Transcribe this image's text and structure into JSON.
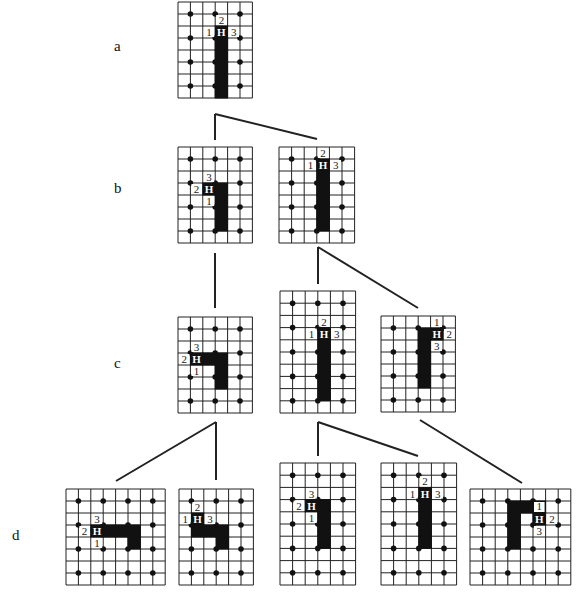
{
  "stage_labels": [
    {
      "id": "a",
      "text": "a",
      "x": 114,
      "y": 38
    },
    {
      "id": "b",
      "text": "b",
      "x": 114,
      "y": 180
    },
    {
      "id": "c",
      "text": "c",
      "x": 114,
      "y": 355
    },
    {
      "id": "d",
      "text": "d",
      "x": 12,
      "y": 527
    }
  ],
  "colors": {
    "line": "#222222",
    "fill": "#111111",
    "dot": "#111111",
    "bg": "#ffffff"
  },
  "grids": [
    {
      "id": "a1",
      "stage": "a",
      "x": 178,
      "y": 2,
      "cols": 6,
      "rows": 8,
      "cw": 12.4,
      "ch": 12.0,
      "dots": {
        "xs": [
          1,
          3,
          5
        ],
        "ys": [
          1,
          3,
          5,
          7
        ]
      },
      "fill": [
        [
          3,
          2
        ],
        [
          3,
          3
        ],
        [
          3,
          4
        ],
        [
          3,
          5
        ],
        [
          3,
          6
        ],
        [
          3,
          7
        ]
      ],
      "H": [
        3,
        2
      ],
      "labels": [
        {
          "t": "2",
          "c": 3,
          "r": 1
        },
        {
          "t": "1",
          "c": 2,
          "r": 2
        },
        {
          "t": "3",
          "c": 4,
          "r": 2
        }
      ]
    },
    {
      "id": "b1",
      "stage": "b",
      "x": 178,
      "y": 147,
      "cols": 6,
      "rows": 8,
      "cw": 12.4,
      "ch": 12.0,
      "dots": {
        "xs": [
          1,
          3,
          5
        ],
        "ys": [
          1,
          3,
          5,
          7
        ]
      },
      "fill": [
        [
          2,
          3
        ],
        [
          3,
          3
        ],
        [
          3,
          4
        ],
        [
          3,
          5
        ],
        [
          3,
          6
        ]
      ],
      "H": [
        2,
        3
      ],
      "labels": [
        {
          "t": "3",
          "c": 2,
          "r": 2
        },
        {
          "t": "2",
          "c": 1,
          "r": 3
        },
        {
          "t": "1",
          "c": 2,
          "r": 4
        }
      ]
    },
    {
      "id": "b2",
      "stage": "b",
      "x": 279,
      "y": 147,
      "cols": 6,
      "rows": 8,
      "cw": 12.6,
      "ch": 12.0,
      "dots": {
        "xs": [
          1,
          3,
          5
        ],
        "ys": [
          1,
          3,
          5,
          7
        ]
      },
      "fill": [
        [
          3,
          1
        ],
        [
          3,
          2
        ],
        [
          3,
          3
        ],
        [
          3,
          4
        ],
        [
          3,
          5
        ],
        [
          3,
          6
        ]
      ],
      "H": [
        3,
        1
      ],
      "labels": [
        {
          "t": "2",
          "c": 3,
          "r": 0
        },
        {
          "t": "1",
          "c": 2,
          "r": 1
        },
        {
          "t": "3",
          "c": 4,
          "r": 1
        }
      ]
    },
    {
      "id": "c1",
      "stage": "c",
      "x": 178,
      "y": 317,
      "cols": 6,
      "rows": 8,
      "cw": 12.4,
      "ch": 12.0,
      "dots": {
        "xs": [
          1,
          3,
          5
        ],
        "ys": [
          1,
          3,
          5,
          7
        ]
      },
      "fill": [
        [
          1,
          3
        ],
        [
          2,
          3
        ],
        [
          3,
          3
        ],
        [
          3,
          4
        ],
        [
          3,
          5
        ]
      ],
      "H": [
        1,
        3
      ],
      "labels": [
        {
          "t": "3",
          "c": 1,
          "r": 2
        },
        {
          "t": "2",
          "c": 0,
          "r": 3
        },
        {
          "t": "1",
          "c": 1,
          "r": 4
        }
      ]
    },
    {
      "id": "c2",
      "stage": "c",
      "x": 280,
      "y": 291,
      "cols": 6,
      "rows": 10,
      "cw": 12.6,
      "ch": 12.2,
      "dots": {
        "xs": [
          1,
          3,
          5
        ],
        "ys": [
          1,
          3,
          5,
          7,
          9
        ]
      },
      "fill": [
        [
          3,
          3
        ],
        [
          3,
          4
        ],
        [
          3,
          5
        ],
        [
          3,
          6
        ],
        [
          3,
          7
        ],
        [
          3,
          8
        ]
      ],
      "H": [
        3,
        3
      ],
      "labels": [
        {
          "t": "2",
          "c": 3,
          "r": 2
        },
        {
          "t": "1",
          "c": 2,
          "r": 3
        },
        {
          "t": "3",
          "c": 4,
          "r": 3
        }
      ]
    },
    {
      "id": "c3",
      "stage": "c",
      "x": 381,
      "y": 316,
      "cols": 6,
      "rows": 8,
      "cw": 12.4,
      "ch": 12.0,
      "dots": {
        "xs": [
          1,
          3,
          5
        ],
        "ys": [
          1,
          3,
          5,
          7
        ]
      },
      "fill": [
        [
          3,
          1
        ],
        [
          4,
          1
        ],
        [
          3,
          2
        ],
        [
          3,
          3
        ],
        [
          3,
          4
        ],
        [
          3,
          5
        ]
      ],
      "H": [
        4,
        1
      ],
      "labels": [
        {
          "t": "1",
          "c": 4,
          "r": 0
        },
        {
          "t": "2",
          "c": 5,
          "r": 1
        },
        {
          "t": "3",
          "c": 4,
          "r": 2
        }
      ]
    },
    {
      "id": "d1",
      "stage": "d",
      "x": 66,
      "y": 489,
      "cols": 8,
      "rows": 8,
      "cw": 12.4,
      "ch": 12.0,
      "dots": {
        "xs": [
          1,
          3,
          5,
          7
        ],
        "ys": [
          1,
          3,
          5,
          7
        ]
      },
      "fill": [
        [
          2,
          3
        ],
        [
          3,
          3
        ],
        [
          4,
          3
        ],
        [
          5,
          3
        ],
        [
          5,
          4
        ]
      ],
      "H": [
        2,
        3
      ],
      "labels": [
        {
          "t": "3",
          "c": 2,
          "r": 2
        },
        {
          "t": "2",
          "c": 1,
          "r": 3
        },
        {
          "t": "1",
          "c": 2,
          "r": 4
        }
      ]
    },
    {
      "id": "d2",
      "stage": "d",
      "x": 179,
      "y": 489,
      "cols": 6,
      "rows": 8,
      "cw": 12.4,
      "ch": 12.0,
      "dots": {
        "xs": [
          1,
          3,
          5
        ],
        "ys": [
          1,
          3,
          5,
          7
        ]
      },
      "fill": [
        [
          1,
          2
        ],
        [
          1,
          3
        ],
        [
          2,
          3
        ],
        [
          3,
          3
        ],
        [
          3,
          4
        ]
      ],
      "H": [
        1,
        2
      ],
      "labels": [
        {
          "t": "2",
          "c": 1,
          "r": 1
        },
        {
          "t": "1",
          "c": 0,
          "r": 2
        },
        {
          "t": "3",
          "c": 2,
          "r": 2
        }
      ]
    },
    {
      "id": "d3",
      "stage": "d",
      "x": 280,
      "y": 463,
      "cols": 6,
      "rows": 10,
      "cw": 12.6,
      "ch": 12.2,
      "dots": {
        "xs": [
          1,
          3,
          5
        ],
        "ys": [
          1,
          3,
          5,
          7,
          9
        ]
      },
      "fill": [
        [
          2,
          3
        ],
        [
          3,
          3
        ],
        [
          3,
          4
        ],
        [
          3,
          5
        ],
        [
          3,
          6
        ]
      ],
      "H": [
        2,
        3
      ],
      "labels": [
        {
          "t": "3",
          "c": 2,
          "r": 2
        },
        {
          "t": "2",
          "c": 1,
          "r": 3
        },
        {
          "t": "1",
          "c": 2,
          "r": 4
        }
      ]
    },
    {
      "id": "d4",
      "stage": "d",
      "x": 381,
      "y": 463,
      "cols": 6,
      "rows": 10,
      "cw": 12.6,
      "ch": 12.2,
      "dots": {
        "xs": [
          1,
          3,
          5
        ],
        "ys": [
          1,
          3,
          5,
          7,
          9
        ]
      },
      "fill": [
        [
          3,
          2
        ],
        [
          3,
          3
        ],
        [
          3,
          4
        ],
        [
          3,
          5
        ],
        [
          3,
          6
        ]
      ],
      "H": [
        3,
        2
      ],
      "labels": [
        {
          "t": "2",
          "c": 3,
          "r": 1
        },
        {
          "t": "1",
          "c": 2,
          "r": 2
        },
        {
          "t": "3",
          "c": 4,
          "r": 2
        }
      ]
    },
    {
      "id": "d5",
      "stage": "d",
      "x": 470,
      "y": 489,
      "cols": 8,
      "rows": 8,
      "cw": 12.6,
      "ch": 12.0,
      "dots": {
        "xs": [
          1,
          3,
          5,
          7
        ],
        "ys": [
          1,
          3,
          5,
          7
        ]
      },
      "fill": [
        [
          3,
          1
        ],
        [
          4,
          1
        ],
        [
          5,
          1
        ],
        [
          3,
          2
        ],
        [
          3,
          3
        ],
        [
          3,
          4
        ]
      ],
      "H": [
        5,
        2
      ],
      "Hcell": [
        5,
        2
      ],
      "fillExtra": [
        [
          5,
          2
        ]
      ],
      "labels": [
        {
          "t": "1",
          "c": 5,
          "r": 1,
          "yoff": -1
        },
        {
          "t": "2",
          "c": 6,
          "r": 2
        },
        {
          "t": "3",
          "c": 5,
          "r": 3
        }
      ]
    }
  ],
  "connectors": [
    [
      215,
      114,
      215,
      140
    ],
    [
      215,
      114,
      317,
      139
    ],
    [
      215,
      253,
      215,
      308
    ],
    [
      318,
      247,
      318,
      284
    ],
    [
      318,
      247,
      418,
      308
    ],
    [
      216,
      422,
      216,
      480
    ],
    [
      216,
      422,
      116,
      481
    ],
    [
      318,
      422,
      318,
      456
    ],
    [
      318,
      422,
      418,
      456
    ],
    [
      420,
      420,
      522,
      483
    ]
  ]
}
